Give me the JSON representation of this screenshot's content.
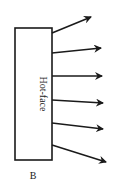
{
  "diagram": {
    "wall": {
      "label": "Hot-face",
      "x": 15,
      "y": 28,
      "width": 37,
      "height": 132,
      "stroke": "#1a1a1a"
    },
    "arrows": [
      {
        "x1": 52,
        "y1": 33,
        "x2": 91,
        "y2": 17
      },
      {
        "x1": 52,
        "y1": 53,
        "x2": 101,
        "y2": 48
      },
      {
        "x1": 52,
        "y1": 76,
        "x2": 102,
        "y2": 76
      },
      {
        "x1": 52,
        "y1": 100,
        "x2": 103,
        "y2": 103
      },
      {
        "x1": 52,
        "y1": 123,
        "x2": 103,
        "y2": 129
      },
      {
        "x1": 52,
        "y1": 145,
        "x2": 106,
        "y2": 162
      }
    ],
    "arrow_color": "#1a1a1a",
    "figure_label": "B"
  }
}
